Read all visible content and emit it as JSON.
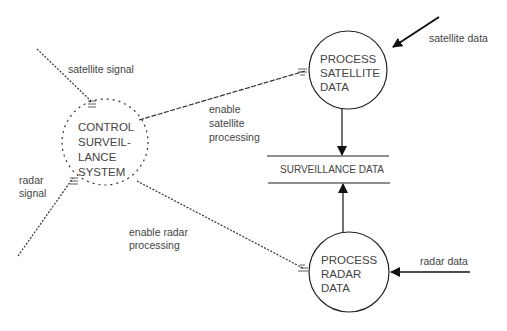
{
  "diagram": {
    "type": "data-flow-diagram",
    "colors": {
      "line": "#111111",
      "text": "#444444",
      "background": "#ffffff"
    },
    "processes": {
      "control": {
        "lines": [
          "CONTROL",
          "SURVEIL-",
          "LANCE",
          "SYSTEM"
        ],
        "style": "dashed"
      },
      "satellite": {
        "lines": [
          "PROCESS",
          "SATELLITE",
          "DATA"
        ],
        "style": "solid"
      },
      "radar": {
        "lines": [
          "PROCESS",
          "RADAR",
          "DATA"
        ],
        "style": "solid"
      }
    },
    "store": {
      "label": "SURVEILLANCE DATA"
    },
    "flows": {
      "satellite_signal": {
        "lines": [
          "satellite signal"
        ]
      },
      "radar_signal": {
        "lines": [
          "radar",
          "signal"
        ]
      },
      "enable_satellite": {
        "lines": [
          "enable",
          "satellite",
          "processing"
        ]
      },
      "enable_radar": {
        "lines": [
          "enable radar",
          "processing"
        ]
      },
      "satellite_data": {
        "lines": [
          "satellite data"
        ]
      },
      "radar_data": {
        "lines": [
          "radar data"
        ]
      }
    }
  }
}
